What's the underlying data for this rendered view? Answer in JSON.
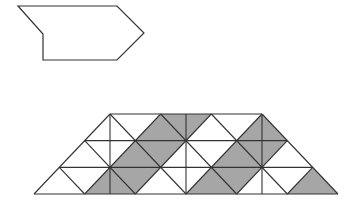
{
  "colors": {
    "background": "#ffffff",
    "stroke": "#333333",
    "shade": "#a6a6a6"
  },
  "shape": {
    "points": [
      [
        18,
        6
      ],
      [
        117,
        6
      ],
      [
        144,
        33
      ],
      [
        117,
        60
      ],
      [
        43,
        60
      ],
      [
        43,
        34
      ]
    ]
  },
  "grid": {
    "origin_x": 34,
    "origin_y": 194,
    "unit_x": 25.333,
    "unit_y": 26.667,
    "columns_bottom": 12,
    "rows": 3,
    "outline": [
      [
        0,
        0
      ],
      [
        12,
        0
      ],
      [
        9,
        3
      ],
      [
        3,
        3
      ]
    ],
    "vertical_lines_i": [
      3,
      6,
      9
    ],
    "shaded_polygons": [
      [
        [
          2,
          0
        ],
        [
          4,
          0
        ],
        [
          5,
          1
        ],
        [
          3,
          1
        ]
      ],
      [
        [
          3,
          1
        ],
        [
          5,
          1
        ],
        [
          6,
          2
        ],
        [
          4,
          2
        ]
      ],
      [
        [
          4,
          2
        ],
        [
          6,
          2
        ],
        [
          7,
          3
        ],
        [
          5,
          3
        ]
      ],
      [
        [
          6,
          0
        ],
        [
          8,
          0
        ],
        [
          9,
          1
        ],
        [
          7,
          1
        ]
      ],
      [
        [
          7,
          1
        ],
        [
          9,
          1
        ],
        [
          10,
          2
        ],
        [
          8,
          2
        ]
      ],
      [
        [
          8,
          2
        ],
        [
          10,
          2
        ],
        [
          9,
          3
        ]
      ],
      [
        [
          10,
          0
        ],
        [
          12,
          0
        ],
        [
          11,
          1
        ]
      ]
    ]
  }
}
